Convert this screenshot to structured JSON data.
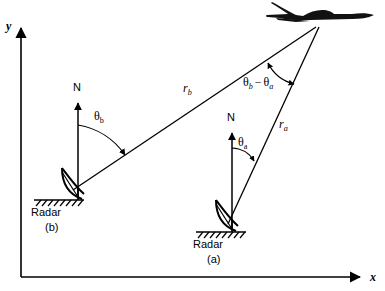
{
  "figure": {
    "kind": "radar-triangulation-diagram",
    "background_color": "#ffffff",
    "stroke_color": "#000000",
    "aircraft_fill": "#111111"
  },
  "axes": {
    "y_label": "y",
    "x_label": "x",
    "origin": {
      "x": 21,
      "y": 277
    },
    "y_tip": {
      "x": 21,
      "y": 24
    },
    "x_tip": {
      "x": 365,
      "y": 277
    }
  },
  "target": {
    "name": "aircraft",
    "apex": {
      "x": 318,
      "y": 26
    }
  },
  "stations": [
    {
      "id": "b",
      "label": "Radar",
      "sublabel": "(b)",
      "north_label": "N",
      "angle_label_base": "θ",
      "angle_label_sub": "b",
      "range_label_base": "r",
      "range_label_sub": "b",
      "position": {
        "x": 78,
        "y": 196
      }
    },
    {
      "id": "a",
      "label": "Radar",
      "sublabel": "(a)",
      "north_label": "N",
      "angle_label_base": "θ",
      "angle_label_sub": "a",
      "range_label_base": "r",
      "range_label_sub": "a",
      "position": {
        "x": 232,
        "y": 228
      }
    }
  ],
  "angles": {
    "difference_label": "θb − θa",
    "difference_parts": {
      "first_base": "θ",
      "first_sub": "b",
      "operator": "−",
      "second_base": "θ",
      "second_sub": "a"
    }
  },
  "labels": {
    "radar_b_name": "Radar",
    "radar_b_id": "(b)",
    "radar_a_name": "Radar",
    "radar_a_id": "(a)",
    "north_b": "N",
    "north_a": "N"
  }
}
